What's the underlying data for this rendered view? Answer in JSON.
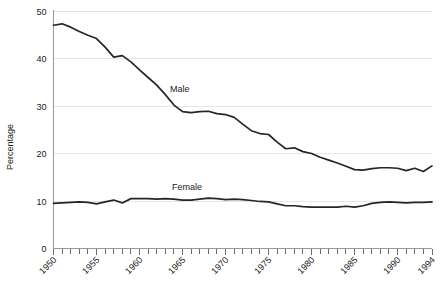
{
  "chart_data": {
    "type": "line",
    "title": "",
    "subtitle": "",
    "xlabel": "",
    "ylabel": "Percentage",
    "xlim": [
      1950,
      1994
    ],
    "ylim": [
      0,
      50
    ],
    "yticks": [
      0,
      10,
      20,
      30,
      40,
      50
    ],
    "ytick_labels": [
      "0",
      "10",
      "20",
      "30",
      "40",
      "50"
    ],
    "xticks": [
      1950,
      1955,
      1960,
      1965,
      1970,
      1975,
      1980,
      1985,
      1990,
      1994
    ],
    "xtick_labels": [
      "1950",
      "1955",
      "1960",
      "1965",
      "1970",
      "1975",
      "1980",
      "1985",
      "1990",
      "1994"
    ],
    "minor_xticks_every": 1,
    "grid": "horizontal",
    "grid_color": "#e6e6e6",
    "legend": "inline-annotations",
    "line_color": "#262626",
    "x": [
      1950,
      1951,
      1952,
      1953,
      1954,
      1955,
      1956,
      1957,
      1958,
      1959,
      1960,
      1961,
      1962,
      1963,
      1964,
      1965,
      1966,
      1967,
      1968,
      1969,
      1970,
      1971,
      1972,
      1973,
      1974,
      1975,
      1976,
      1977,
      1978,
      1979,
      1980,
      1981,
      1982,
      1983,
      1984,
      1985,
      1986,
      1987,
      1988,
      1989,
      1990,
      1991,
      1992,
      1993,
      1994
    ],
    "series": [
      {
        "name": "Male",
        "label": "Male",
        "values": [
          47.0,
          47.3,
          46.6,
          45.7,
          44.9,
          44.2,
          42.4,
          40.3,
          40.6,
          39.3,
          37.6,
          36.0,
          34.4,
          32.4,
          30.2,
          28.8,
          28.6,
          28.8,
          28.9,
          28.4,
          28.2,
          27.6,
          26.2,
          24.8,
          24.2,
          24.0,
          22.4,
          21.0,
          21.2,
          20.4,
          20.0,
          19.2,
          18.6,
          18.0,
          17.3,
          16.6,
          16.5,
          16.8,
          17.0,
          17.0,
          16.9,
          16.4,
          16.9,
          16.2,
          17.4
        ]
      },
      {
        "name": "Female",
        "label": "Female",
        "values": [
          9.5,
          9.6,
          9.7,
          9.8,
          9.7,
          9.4,
          9.8,
          10.2,
          9.6,
          10.5,
          10.5,
          10.5,
          10.4,
          10.5,
          10.4,
          10.2,
          10.2,
          10.4,
          10.6,
          10.5,
          10.3,
          10.4,
          10.3,
          10.1,
          9.9,
          9.8,
          9.4,
          9.0,
          9.0,
          8.8,
          8.7,
          8.7,
          8.7,
          8.7,
          8.9,
          8.7,
          9.0,
          9.5,
          9.7,
          9.8,
          9.7,
          9.6,
          9.7,
          9.7,
          9.8
        ]
      }
    ],
    "annotations": [
      {
        "text": "Male",
        "x_px": 170,
        "y_px": 92
      },
      {
        "text": "Female",
        "x_px": 172,
        "y_px": 190
      }
    ]
  }
}
